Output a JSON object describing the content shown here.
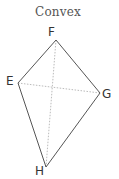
{
  "title": "Convex",
  "quadrilateral": {
    "vertices": [
      {
        "label": "F",
        "x": 56,
        "y": 40
      },
      {
        "label": "G",
        "x": 100,
        "y": 93
      },
      {
        "label": "H",
        "x": 46,
        "y": 167
      },
      {
        "label": "E",
        "x": 18,
        "y": 83
      }
    ],
    "diagonals": [
      [
        "F",
        "H"
      ],
      [
        "E",
        "G"
      ]
    ]
  },
  "labels": {
    "F": "F",
    "E": "E",
    "G": "G",
    "H": "H"
  },
  "colors": {
    "edge": "#555555",
    "diagonal": "#bbbbbb",
    "text": "#333333"
  }
}
